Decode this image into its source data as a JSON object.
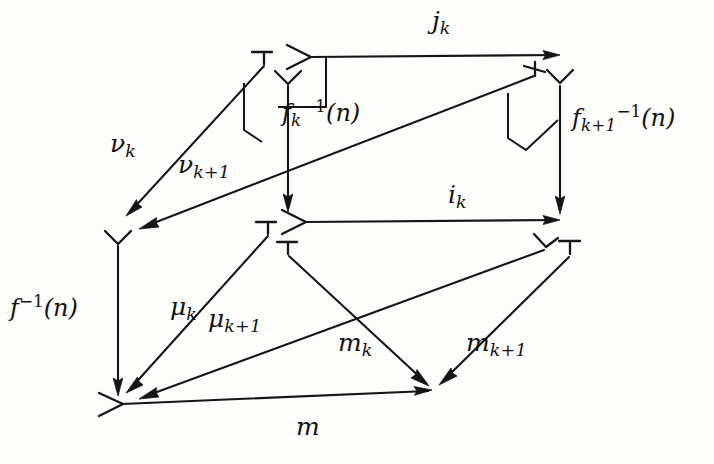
{
  "diagram": {
    "kind": "commutative-diagram",
    "ink_color": "#151515",
    "background_color": "#fdfdfc",
    "labels": {
      "j_k": {
        "base": "j",
        "sub": "k",
        "text": "j_k"
      },
      "i_k": {
        "base": "i",
        "sub": "k",
        "text": "i_k"
      },
      "m": {
        "base": "m",
        "sub": "",
        "text": "m"
      },
      "m_k": {
        "base": "m",
        "sub": "k",
        "text": "m_k"
      },
      "m_k1": {
        "base": "m",
        "sub": "k+1",
        "text": "m_{k+1}"
      },
      "nu_k": {
        "base": "ν",
        "sub": "k",
        "text": "ν_k"
      },
      "nu_k1": {
        "base": "ν",
        "sub": "k+1",
        "text": "ν_{k+1}"
      },
      "mu_k": {
        "base": "μ",
        "sub": "k",
        "text": "μ_k"
      },
      "mu_k1": {
        "base": "μ",
        "sub": "k+1",
        "text": "μ_{k+1}"
      },
      "f_inv_n": {
        "base": "f",
        "sub": "",
        "sup": "−1",
        "arg": "(n)",
        "text": "f^{-1}(n)"
      },
      "fk_inv_n": {
        "base": "f",
        "sub": "k",
        "sup": "−1",
        "arg": "(n)",
        "text": "f_k^{-1}(n)"
      },
      "fk1_inv_n": {
        "base": "f",
        "sub": "k+1",
        "sup": "−1",
        "arg": "(n)",
        "text": "f_{k+1}^{-1}(n)"
      }
    },
    "arrows": [
      {
        "id": "j_k",
        "label": "j_k",
        "kind": "monomorphism",
        "from": [
          310,
          57
        ],
        "to": [
          560,
          55
        ]
      },
      {
        "id": "i_k",
        "label": "i_k",
        "kind": "monomorphism",
        "from": [
          305,
          222
        ],
        "to": [
          560,
          220
        ]
      },
      {
        "id": "m",
        "label": "m",
        "kind": "monomorphism",
        "from": [
          122,
          404
        ],
        "to": [
          432,
          390
        ]
      },
      {
        "id": "nu_k",
        "label": "ν_k",
        "kind": "plain",
        "from": [
          264,
          62
        ],
        "to": [
          128,
          214
        ]
      },
      {
        "id": "nu_k1",
        "label": "ν_{k+1}",
        "kind": "plain",
        "from": [
          535,
          73
        ],
        "to": [
          140,
          229
        ]
      },
      {
        "id": "fk_inv",
        "label": "f_k^{-1}(n)",
        "kind": "plain",
        "from": [
          288,
          82
        ],
        "to": [
          288,
          210
        ]
      },
      {
        "id": "fk1_inv",
        "label": "f_{k+1}^{-1}(n)",
        "kind": "plain",
        "from": [
          560,
          82
        ],
        "to": [
          560,
          212
        ]
      },
      {
        "id": "f_inv",
        "label": "f^{-1}(n)",
        "kind": "plain",
        "from": [
          118,
          242
        ],
        "to": [
          118,
          394
        ]
      },
      {
        "id": "mu_k",
        "label": "μ_k",
        "kind": "plain",
        "from": [
          268,
          231
        ],
        "to": [
          128,
          392
        ]
      },
      {
        "id": "mu_k1",
        "label": "μ_{k+1}",
        "kind": "plain",
        "from": [
          545,
          246
        ],
        "to": [
          140,
          400
        ]
      },
      {
        "id": "m_k",
        "label": "m_k",
        "kind": "plain",
        "from": [
          288,
          251
        ],
        "to": [
          428,
          384
        ]
      },
      {
        "id": "m_k1",
        "label": "m_{k+1}",
        "kind": "plain",
        "from": [
          570,
          252
        ],
        "to": [
          440,
          384
        ]
      }
    ],
    "pullback_markers": [
      {
        "id": "pullback-left",
        "at": [
          244,
          85
        ]
      },
      {
        "id": "pullback-right",
        "at": [
          508,
          95
        ]
      }
    ],
    "label_positions": {
      "j_k": [
        432,
        10
      ],
      "i_k": [
        448,
        184
      ],
      "m": [
        295,
        416
      ],
      "nu_k": [
        112,
        133
      ],
      "nu_k1": [
        180,
        153
      ],
      "mu_k": [
        172,
        295
      ],
      "mu_k1": [
        210,
        305
      ],
      "m_k": [
        340,
        330
      ],
      "m_k1": [
        466,
        330
      ],
      "f_inv_n": [
        12,
        295
      ],
      "fk_inv_n": [
        282,
        100
      ],
      "fk1_inv_n": [
        572,
        105
      ]
    }
  }
}
